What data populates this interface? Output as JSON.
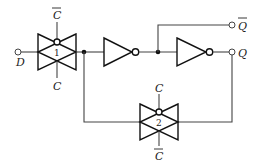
{
  "diagram": {
    "type": "CMOS D latch (transmission gates + inverters)",
    "labels": {
      "input_d": "D",
      "output_q": "Q",
      "output_q_bar": "Q",
      "tg1_top": "C",
      "tg1_bottom": "C",
      "tg2_top": "C",
      "tg2_bottom": "C"
    },
    "overbars": {
      "output_q_bar": true,
      "tg1_top": true,
      "tg1_bottom": false,
      "tg2_top": false,
      "tg2_bottom": true
    },
    "gates": [
      {
        "id": "tg1",
        "kind": "transmission-gate",
        "number": "1"
      },
      {
        "id": "inv1",
        "kind": "inverter"
      },
      {
        "id": "inv2",
        "kind": "inverter"
      },
      {
        "id": "tg2",
        "kind": "transmission-gate",
        "number": "2"
      }
    ],
    "colors": {
      "line": "#444444",
      "gate": "#111111",
      "background": "#ffffff"
    }
  }
}
